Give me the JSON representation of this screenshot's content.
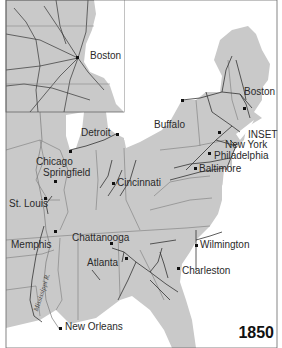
{
  "map": {
    "year": "1850",
    "inset_label": "INSET",
    "river_label": "Mississippi R.",
    "colors": {
      "land": "#c9c9c9",
      "water": "#ffffff",
      "borders": "#7a7a7a",
      "railroads": "#333333",
      "frame": "#666666"
    },
    "inset_cities": [
      {
        "name": "Boston"
      }
    ],
    "cities": [
      {
        "name": "Boston"
      },
      {
        "name": "Buffalo"
      },
      {
        "name": "Detroit"
      },
      {
        "name": "New York"
      },
      {
        "name": "Philadelphia"
      },
      {
        "name": "Baltimore"
      },
      {
        "name": "Chicago"
      },
      {
        "name": "Springfield"
      },
      {
        "name": "Cincinnati"
      },
      {
        "name": "St. Louis"
      },
      {
        "name": "Memphis"
      },
      {
        "name": "Chattanooga"
      },
      {
        "name": "Atlanta"
      },
      {
        "name": "Wilmington"
      },
      {
        "name": "Charleston"
      },
      {
        "name": "New Orleans"
      }
    ]
  }
}
